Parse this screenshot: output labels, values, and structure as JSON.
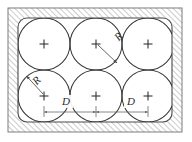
{
  "figure": {
    "kind": "engineering-diagram",
    "canvas": {
      "width": 192,
      "height": 142
    },
    "colors": {
      "background": "#ffffff",
      "stroke": "#3a3a3a",
      "hatch": "#8c8c8c",
      "frame": "#4a4a4a",
      "dimension": "#6a6a6a",
      "label": "#2b2b2b"
    },
    "frame": {
      "outer": {
        "x": 8,
        "y": 8,
        "width": 174,
        "height": 124
      },
      "inner": {
        "x": 18,
        "y": 18,
        "width": 154,
        "height": 104,
        "corner_radius": 9
      },
      "hatch_band_thickness": 10,
      "hatch_angle_degrees": 45,
      "hatch_spacing": 4
    },
    "circles": {
      "radius": 26,
      "rows": 2,
      "columns": 3,
      "centers": [
        {
          "cx": 44,
          "cy": 44,
          "marker": "+"
        },
        {
          "cx": 96,
          "cy": 44,
          "marker": "+"
        },
        {
          "cx": 148,
          "cy": 44,
          "marker": "+"
        },
        {
          "cx": 44,
          "cy": 96,
          "marker": "+"
        },
        {
          "cx": 96,
          "cy": 96,
          "marker": "+"
        },
        {
          "cx": 148,
          "cy": 96,
          "marker": "+"
        }
      ]
    },
    "labels": {
      "radius_symbol": "R",
      "spacing_symbol": "D"
    },
    "annotations": [
      {
        "name": "radius-callout-upper",
        "symbol": "R",
        "label_x": 121,
        "label_y": 39,
        "from": {
          "x": 96,
          "y": 44
        },
        "to": {
          "x": 117,
          "y": 63
        }
      },
      {
        "name": "radius-callout-lower",
        "symbol": "R",
        "label_x": 39,
        "label_y": 83,
        "from": {
          "x": 44,
          "y": 96
        },
        "to": {
          "x": 26,
          "y": 76
        }
      }
    ],
    "dimensions": [
      {
        "name": "dimension-d-left",
        "symbol": "D",
        "label_x": 66,
        "label_y": 104,
        "line_y": 112,
        "x_start": 44,
        "x_end": 96
      },
      {
        "name": "dimension-d-right",
        "symbol": "D",
        "label_x": 131,
        "label_y": 104,
        "line_y": 112,
        "x_start": 96,
        "x_end": 148
      }
    ]
  }
}
